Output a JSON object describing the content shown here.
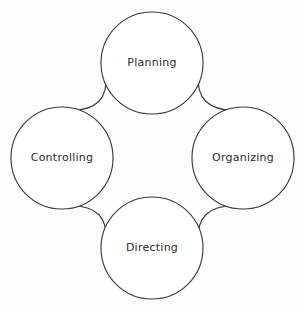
{
  "diagram": {
    "type": "cycle-diagram",
    "background_color": "#fdfdfd",
    "stroke_color": "#3b3b3b",
    "label_color": "#2b2b2b",
    "node_fill": "#ffffff",
    "nodes": [
      {
        "id": "planning",
        "label": "Planning",
        "position": "top",
        "cx": 152,
        "cy": 63,
        "r": 51
      },
      {
        "id": "organizing",
        "label": "Organizing",
        "position": "right",
        "cx": 243,
        "cy": 158,
        "r": 51
      },
      {
        "id": "directing",
        "label": "Directing",
        "position": "bottom",
        "cx": 152,
        "cy": 248,
        "r": 51
      },
      {
        "id": "controlling",
        "label": "Controlling",
        "position": "left",
        "cx": 62,
        "cy": 158,
        "r": 51
      }
    ],
    "connectors": [
      {
        "id": "controlling-to-planning",
        "from": "controlling",
        "to": "planning",
        "path": "M 70.5 110.5 Q 110 110 105.5 74.5"
      },
      {
        "id": "planning-to-organizing",
        "from": "planning",
        "to": "organizing",
        "path": "M 198.5 74.5 Q 195 110 234.5 110.5"
      },
      {
        "id": "organizing-to-directing",
        "from": "organizing",
        "to": "directing",
        "path": "M 234.5 205.5 Q 195 206 198.5 241.5"
      },
      {
        "id": "directing-to-controlling",
        "from": "directing",
        "to": "controlling",
        "path": "M 105.5 241.5 Q 110 206 70.5 205.5"
      }
    ]
  }
}
